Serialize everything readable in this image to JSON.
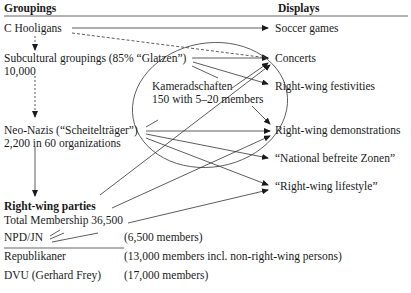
{
  "header": {
    "left": "Groupings",
    "right": "Displays"
  },
  "groupings": {
    "hooligans": "C Hooligans",
    "subcultural": "Subcultural groupings (85% “Glatzen”)",
    "subcultural_count": "10,000",
    "kameradschaften": "Kameradschaften",
    "kameradschaften_count": "150 with 5–20 members",
    "neonazis": "Neo-Nazis (“Scheitelträger”)",
    "neonazis_count": "2,200 in 60 organizations",
    "parties_title": "Right-wing parties",
    "parties_total": "Total Membership 36,500"
  },
  "parties": [
    {
      "name": "NPD/JN",
      "members": "(6,500 members)"
    },
    {
      "name": "Republikaner",
      "members": "(13,000 members incl. non-right-wing persons)"
    },
    {
      "name": "DVU (Gerhard Frey)",
      "members": "(17,000 members)"
    }
  ],
  "displays": [
    "Soccer games",
    "Concerts",
    "Right-wing festivities",
    "Right-wing demonstrations",
    "“National befreite Zonen”",
    "“Right-wing lifestyle”"
  ]
}
